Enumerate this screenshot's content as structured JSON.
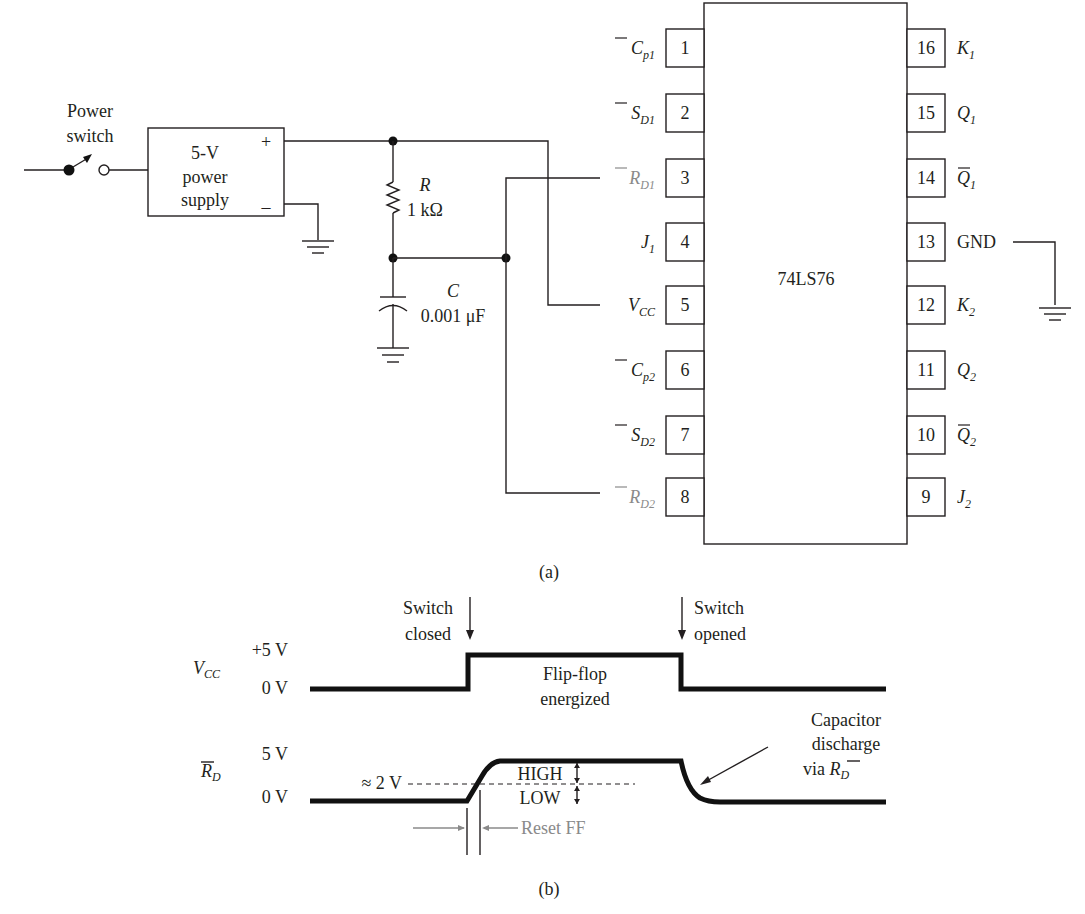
{
  "figure": {
    "caption_a": "(a)",
    "caption_b": "(b)"
  },
  "circuit": {
    "power_switch_label": [
      "Power",
      "switch"
    ],
    "power_supply_label": [
      "5-V",
      "power",
      "supply"
    ],
    "supply_plus": "+",
    "supply_minus": "–",
    "resistor": {
      "name": "R",
      "value": "1 kΩ"
    },
    "capacitor": {
      "name": "C",
      "value": "0.001 μF"
    },
    "chip_name": "74LS76",
    "left_pins": [
      {
        "num": "1",
        "label": "C",
        "sub": "p1",
        "overbar": true,
        "gray": false
      },
      {
        "num": "2",
        "label": "S",
        "sub": "D1",
        "overbar": true,
        "gray": false
      },
      {
        "num": "3",
        "label": "R",
        "sub": "D1",
        "overbar": true,
        "gray": true
      },
      {
        "num": "4",
        "label": "J",
        "sub": "1",
        "overbar": false,
        "gray": false
      },
      {
        "num": "5",
        "label": "V",
        "sub": "CC",
        "overbar": false,
        "gray": false
      },
      {
        "num": "6",
        "label": "C",
        "sub": "p2",
        "overbar": true,
        "gray": false
      },
      {
        "num": "7",
        "label": "S",
        "sub": "D2",
        "overbar": true,
        "gray": false
      },
      {
        "num": "8",
        "label": "R",
        "sub": "D2",
        "overbar": true,
        "gray": true
      }
    ],
    "right_pins": [
      {
        "num": "16",
        "label": "K",
        "sub": "1",
        "overbar": false
      },
      {
        "num": "15",
        "label": "Q",
        "sub": "1",
        "overbar": false
      },
      {
        "num": "14",
        "label": "Q",
        "sub": "1",
        "overbar": true
      },
      {
        "num": "13",
        "label": "GND",
        "sub": "",
        "overbar": false
      },
      {
        "num": "12",
        "label": "K",
        "sub": "2",
        "overbar": false
      },
      {
        "num": "11",
        "label": "Q",
        "sub": "2",
        "overbar": false
      },
      {
        "num": "10",
        "label": "Q",
        "sub": "2",
        "overbar": true
      },
      {
        "num": "9",
        "label": "J",
        "sub": "2",
        "overbar": false
      }
    ]
  },
  "timing": {
    "vcc_signal": {
      "label": "V",
      "sub": "CC",
      "high": "+5 V",
      "low": "0 V"
    },
    "rd_signal": {
      "label": "R",
      "sub": "D",
      "high": "5 V",
      "low": "0 V"
    },
    "switch_closed": [
      "Switch",
      "closed"
    ],
    "switch_opened": [
      "Switch",
      "opened"
    ],
    "flipflop_energized": [
      "Flip-flop",
      "energized"
    ],
    "threshold": "≈ 2 V",
    "high_label": "HIGH",
    "low_label": "LOW",
    "reset_ff": "Reset FF",
    "capacitor_discharge": [
      "Capacitor",
      "discharge",
      "via "
    ],
    "via_label": "R",
    "via_sub": "D"
  }
}
